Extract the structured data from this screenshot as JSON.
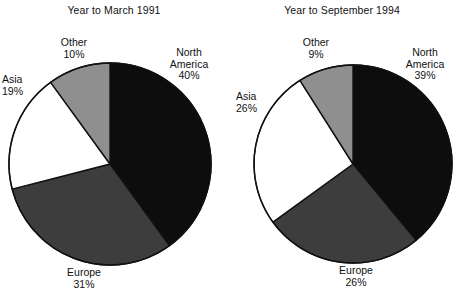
{
  "figure": {
    "background": "#ffffff",
    "text_color": "#111111"
  },
  "chart_data": [
    {
      "type": "pie",
      "title": "Year to March 1991",
      "categories": [
        "North America",
        "Europe",
        "Asia",
        "Other"
      ],
      "values": [
        40,
        31,
        19,
        10
      ],
      "value_labels": [
        "40%",
        "31%",
        "19%",
        "10%"
      ],
      "colors": [
        "#0d0d0d",
        "#3d3d3d",
        "#ffffff",
        "#8f8f8f"
      ],
      "unit": "%",
      "start_angle_deg": 0,
      "direction": "clockwise",
      "legend": "none",
      "grid": false,
      "xlabel": "",
      "ylabel": ""
    },
    {
      "type": "pie",
      "title": "Year to September 1994",
      "categories": [
        "North America",
        "Europe",
        "Asia",
        "Other"
      ],
      "values": [
        39,
        26,
        26,
        9
      ],
      "value_labels": [
        "39%",
        "26%",
        "26%",
        "9%"
      ],
      "colors": [
        "#0d0d0d",
        "#3d3d3d",
        "#ffffff",
        "#8f8f8f"
      ],
      "unit": "%",
      "start_angle_deg": 0,
      "direction": "clockwise",
      "legend": "none",
      "grid": false,
      "xlabel": "",
      "ylabel": ""
    }
  ],
  "panels": [
    {
      "title": "Year to March 1991",
      "labels": {
        "north_america": {
          "name": "North",
          "name2": "America",
          "pct": "40%"
        },
        "europe": {
          "name": "Europe",
          "pct": "31%"
        },
        "asia": {
          "name": "Asia",
          "pct": "19%"
        },
        "other": {
          "name": "Other",
          "pct": "10%"
        }
      }
    },
    {
      "title": "Year to September 1994",
      "labels": {
        "north_america": {
          "name": "North",
          "name2": "America",
          "pct": "39%"
        },
        "europe": {
          "name": "Europe",
          "pct": "26%"
        },
        "asia": {
          "name": "Asia",
          "pct": "26%"
        },
        "other": {
          "name": "Other",
          "pct": "9%"
        }
      }
    }
  ]
}
